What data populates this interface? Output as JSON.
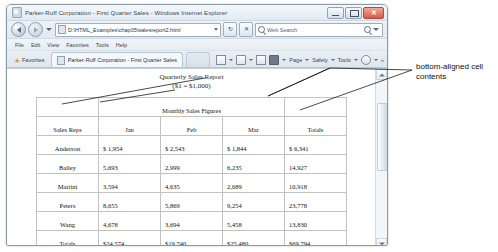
{
  "window": {
    "title": "Parker-Ruff Corporation - First Quarter Sales - Windows Internet Explorer",
    "minimize_label": "–",
    "maximize_label": "□",
    "close_label": "✕"
  },
  "address_bar": {
    "url": "D:\\HTML_Examples\\chap05\\salesreport2.html",
    "refresh_label": "↻",
    "stop_label": "✕",
    "search_placeholder": "Web Search",
    "back_icon": "back-arrow-icon",
    "forward_icon": "forward-arrow-icon"
  },
  "menu": {
    "items": [
      "File",
      "Edit",
      "View",
      "Favorites",
      "Tools",
      "Help"
    ]
  },
  "favorites_bar": {
    "favorites_label": "Favorites",
    "star_glyph": "★",
    "tab_label": "Parker-Ruff Corporation - First Quarter Sales"
  },
  "command_bar": {
    "items": [
      "Page",
      "Safety",
      "Tools"
    ],
    "overflow_label": "»"
  },
  "page": {
    "report_title": "Quarterly Sales Report",
    "report_subtitle": "($1 = $1,000)",
    "table": {
      "group_header": "Monthly Sales Figures",
      "columns": [
        "Sales Reps",
        "Jan",
        "Feb",
        "Mar",
        "Totals"
      ],
      "rows": [
        {
          "name": "Anderson",
          "jan": "$ 1,954",
          "feb": "$ 2,543",
          "mar": "$ 1,844",
          "total": "$ 6,341"
        },
        {
          "name": "Bailey",
          "jan": "5,693",
          "feb": "2,999",
          "mar": "6,235",
          "total": "14,927"
        },
        {
          "name": "Martini",
          "jan": "3,594",
          "feb": "4,635",
          "mar": "2,689",
          "total": "10,918"
        },
        {
          "name": "Peters",
          "jan": "8,655",
          "feb": "5,869",
          "mar": "9,254",
          "total": "23,778"
        },
        {
          "name": "Wang",
          "jan": "4,678",
          "feb": "3,694",
          "mar": "5,458",
          "total": "13,830"
        },
        {
          "name": "Totals",
          "jan": "$24,574",
          "feb": "$19,740",
          "mar": "$25,480",
          "total": "$69,794"
        }
      ]
    }
  },
  "annotation": {
    "text": "bottom-aligned cell contents"
  },
  "colors": {
    "table_border": "#c2c2c2",
    "text": "#111111",
    "chrome": "#e2eaf2"
  }
}
